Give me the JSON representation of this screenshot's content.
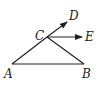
{
  "diagram": {
    "type": "geometry",
    "stroke_color": "#222222",
    "points": {
      "A": {
        "label": "A",
        "x": 12,
        "y": 64
      },
      "B": {
        "label": "B",
        "x": 84,
        "y": 64
      },
      "C": {
        "label": "C",
        "x": 47,
        "y": 37
      },
      "D": {
        "label": "D",
        "x": 67,
        "y": 22
      },
      "E": {
        "label": "E",
        "x": 82,
        "y": 37
      }
    },
    "segments": [
      [
        "A",
        "B"
      ],
      [
        "A",
        "C"
      ],
      [
        "C",
        "B"
      ]
    ],
    "rays": [
      [
        "C",
        "D"
      ],
      [
        "C",
        "E"
      ]
    ],
    "labels": {
      "A": "A",
      "B": "B",
      "C": "C",
      "D": "D",
      "E": "E"
    }
  }
}
